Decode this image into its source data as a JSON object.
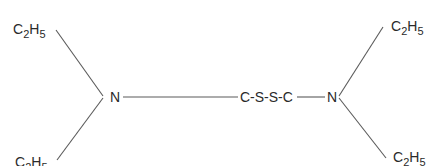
{
  "diagram": {
    "type": "structural-formula",
    "molecule": "tetraethylthiuram disulfide (skeletal)",
    "groups": {
      "ethyl_top_left": {
        "element": "C",
        "c_count": "2",
        "h": "H",
        "h_count": "5"
      },
      "ethyl_bottom_left": {
        "element": "C",
        "c_count": "2",
        "h": "H",
        "h_count": "5"
      },
      "ethyl_top_right": {
        "element": "C",
        "c_count": "2",
        "h": "H",
        "h_count": "5"
      },
      "ethyl_bottom_right": {
        "element": "C",
        "c_count": "2",
        "h": "H",
        "h_count": "5"
      },
      "nitrogen_left": "N",
      "nitrogen_right": "N",
      "central_chain": "C-S-S-C"
    },
    "bonds": [
      {
        "from": "ethyl_top_left",
        "to": "nitrogen_left"
      },
      {
        "from": "ethyl_bottom_left",
        "to": "nitrogen_left"
      },
      {
        "from": "nitrogen_left",
        "to": "central_chain"
      },
      {
        "from": "central_chain",
        "to": "nitrogen_right"
      },
      {
        "from": "nitrogen_right",
        "to": "ethyl_top_right"
      },
      {
        "from": "nitrogen_right",
        "to": "ethyl_bottom_right"
      }
    ]
  }
}
